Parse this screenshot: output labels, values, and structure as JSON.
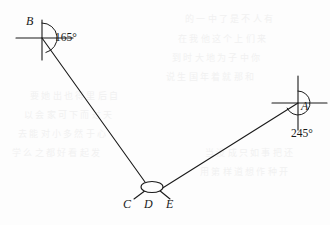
{
  "figure": {
    "type": "geometry-bearing-diagram",
    "background_color": "#fdfdfd",
    "stroke_color": "#1a1a1a",
    "points": {
      "B": {
        "label": "B",
        "x": 42,
        "y": 38
      },
      "A": {
        "label": "A",
        "x": 298,
        "y": 103
      },
      "vertex": {
        "label": "D",
        "x": 152,
        "y": 187
      }
    },
    "labels": {
      "point_b": "B",
      "point_a": "A",
      "point_c": "C",
      "point_d": "D",
      "point_e": "E"
    },
    "angles": {
      "at_b": "165°",
      "at_a": "245°"
    },
    "north_lines": [
      {
        "name": "north-line-b",
        "x": 42,
        "y_top": 20,
        "y_bottom": 60
      },
      {
        "name": "north-line-a",
        "x": 298,
        "y_top": 76,
        "y_bottom": 130
      }
    ],
    "east_lines": [
      {
        "name": "east-line-b",
        "y": 38,
        "x_left": 16,
        "x_right": 73
      },
      {
        "name": "east-line-a",
        "y": 103,
        "x_left": 272,
        "x_right": 327
      }
    ],
    "segments": [
      {
        "name": "segment-b-to-vertex",
        "x1": 42,
        "y1": 38,
        "x2": 146,
        "y2": 183
      },
      {
        "name": "segment-vertex-to-a",
        "x1": 160,
        "y1": 189,
        "x2": 298,
        "y2": 103
      },
      {
        "name": "segment-vertex-lower-left",
        "x1": 145,
        "y1": 191,
        "x2": 133,
        "y2": 198
      },
      {
        "name": "segment-vertex-lower-right",
        "x1": 160,
        "y1": 191,
        "x2": 170,
        "y2": 198
      }
    ],
    "ellipse": {
      "name": "vertex-ellipse",
      "cx": 152,
      "cy": 187,
      "rx": 11,
      "ry": 5.5
    },
    "arcs": [
      {
        "name": "angle-arc-b",
        "center_x": 42,
        "center_y": 38,
        "radius": 15
      },
      {
        "name": "angle-arc-a",
        "center_x": 298,
        "center_y": 103,
        "radius": 12
      }
    ]
  },
  "ghost_text": [
    {
      "text": "的 一 中 了 是 不 人 有",
      "x": 185,
      "y": 18
    },
    {
      "text": "在 我 他 这 个 上 们 来",
      "x": 178,
      "y": 38
    },
    {
      "text": "到 时 大 地 为 子 中 你",
      "x": 172,
      "y": 57
    },
    {
      "text": "说 生 国 年 着 就 那 和",
      "x": 166,
      "y": 76
    },
    {
      "text": "要 她 出 也 得 里 后 自",
      "x": 30,
      "y": 95
    },
    {
      "text": "以 会 家 可 下 而 过 天",
      "x": 24,
      "y": 114
    },
    {
      "text": "去 能 对 小 多 然 于 心",
      "x": 18,
      "y": 133
    },
    {
      "text": "学 么 之 都 好 看 起 发",
      "x": 12,
      "y": 152
    },
    {
      "text": "当 没 成 只 如 事 把 还",
      "x": 205,
      "y": 152
    },
    {
      "text": "用 第 样 道 想 作 种 开",
      "x": 200,
      "y": 171
    }
  ]
}
